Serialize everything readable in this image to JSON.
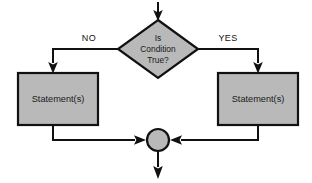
{
  "diagram": {
    "type": "flowchart",
    "background_color": "#ffffff",
    "shape_fill_color": "#b9b9b9",
    "shape_stroke_color": "#111111",
    "connector_color": "#111111"
  },
  "nodes": {
    "entry_arrow": {
      "name": "entry-flow-arrow",
      "shape": "arrow",
      "direction": "down"
    },
    "decision": {
      "name": "decision-diamond",
      "shape": "diamond",
      "line1": "Is",
      "line2": "Condition",
      "line3": "True?"
    },
    "false_branch_box": {
      "name": "false-statement-box",
      "shape": "rectangle",
      "label": "Statement(s)"
    },
    "true_branch_box": {
      "name": "true-statement-box",
      "shape": "rectangle",
      "label": "Statement(s)"
    },
    "merge_point": {
      "name": "merge-connector-circle",
      "shape": "circle",
      "label": ""
    },
    "exit_arrow": {
      "name": "exit-flow-arrow",
      "shape": "arrow",
      "direction": "down"
    }
  },
  "edge_labels": {
    "no_label": "NO",
    "yes_label": "YES"
  }
}
